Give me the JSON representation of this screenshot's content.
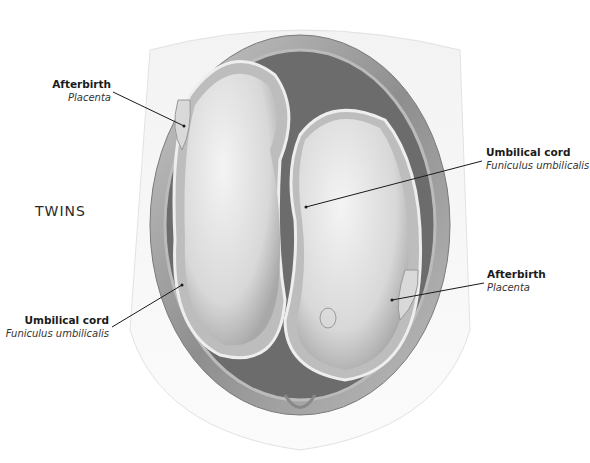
{
  "title": "TWINS",
  "labels": [
    {
      "id": "afterbirth-left",
      "term": "Afterbirth",
      "latin": "Placenta"
    },
    {
      "id": "umbilical-cord-left",
      "term": "Umbilical cord",
      "latin": "Funiculus umbilicalis"
    },
    {
      "id": "umbilical-cord-right",
      "term": "Umbilical cord",
      "latin": "Funiculus umbilicalis"
    },
    {
      "id": "afterbirth-right",
      "term": "Afterbirth",
      "latin": "Placenta"
    }
  ],
  "colors": {
    "leader": "#1a1a1a",
    "uterus_wall": "#9a9a9a",
    "skin": "#e6e6e6",
    "background": "#ffffff"
  }
}
